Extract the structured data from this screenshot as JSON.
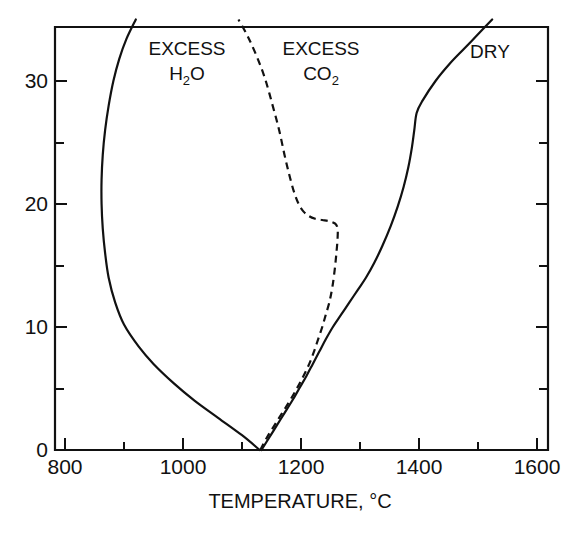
{
  "chart_data": {
    "type": "line",
    "title": "",
    "subtitle": "",
    "xlabel": "TEMPERATURE, °C",
    "ylabel": "",
    "xlim": [
      800,
      1600
    ],
    "ylim": [
      0,
      35
    ],
    "grid": false,
    "legend_position": "inline-annotations",
    "x_ticks_major": [
      800,
      1000,
      1200,
      1400,
      1600
    ],
    "x_ticks_minor": [
      900,
      1100,
      1300,
      1500
    ],
    "x_tick_labels": [
      "800",
      "1000",
      "1200",
      "1400",
      "1600"
    ],
    "y_ticks_major": [
      0,
      10,
      20,
      30
    ],
    "y_ticks_minor": [
      5,
      15,
      25
    ],
    "y_tick_labels": [
      "0",
      "10",
      "20",
      "30"
    ],
    "series": [
      {
        "name": "EXCESS H2O",
        "label_line1": "EXCESS",
        "label_line2_base": "H",
        "label_line2_sub": "2",
        "label_line2_tail": "O",
        "style": "solid",
        "color": "#111111",
        "x": [
          1130,
          1100,
          1060,
          1020,
          985,
          950,
          925,
          900,
          885,
          874,
          868,
          864,
          862,
          862,
          864,
          868,
          874,
          882,
          892,
          904,
          920
        ],
        "y": [
          0,
          1.2,
          2.6,
          4.0,
          5.4,
          7.0,
          8.4,
          10.2,
          12.0,
          14.0,
          16.0,
          18.0,
          20.0,
          22.0,
          24.0,
          26.0,
          28.0,
          30.0,
          31.8,
          33.4,
          35.0
        ]
      },
      {
        "name": "EXCESS CO2",
        "label_line1": "EXCESS",
        "label_line2_base": "CO",
        "label_line2_sub": "2",
        "label_line2_tail": "",
        "style": "dashed",
        "color": "#111111",
        "x": [
          1131,
          1142,
          1155,
          1168,
          1181,
          1193,
          1204,
          1214,
          1222,
          1229,
          1236,
          1242,
          1248,
          1253,
          1257,
          1260,
          1262,
          1262,
          1258,
          1248,
          1236,
          1224,
          1214,
          1204,
          1196,
          1188,
          1180,
          1172,
          1163,
          1152,
          1139,
          1125,
          1110,
          1094
        ],
        "y": [
          0,
          1.0,
          2.0,
          3.0,
          4.0,
          5.0,
          6.0,
          7.0,
          8.0,
          9.0,
          10.0,
          11.0,
          12.0,
          13.2,
          14.6,
          16.0,
          17.2,
          18.0,
          18.4,
          18.6,
          18.7,
          18.8,
          19.0,
          19.4,
          20.0,
          21.0,
          22.4,
          24.0,
          26.0,
          28.0,
          30.2,
          32.0,
          33.6,
          35.0
        ]
      },
      {
        "name": "DRY",
        "label_line1": "DRY",
        "label_line2_base": "",
        "label_line2_sub": "",
        "label_line2_tail": "",
        "style": "solid",
        "color": "#111111",
        "x": [
          1133,
          1146,
          1159,
          1172,
          1185,
          1197,
          1209,
          1220,
          1231,
          1242,
          1254,
          1268,
          1282,
          1296,
          1310,
          1324,
          1338,
          1352,
          1364,
          1374,
          1382,
          1388,
          1392,
          1396,
          1406,
          1428,
          1452,
          1476,
          1500,
          1524
        ],
        "y": [
          0,
          1.0,
          2.0,
          3.0,
          4.0,
          5.0,
          6.0,
          7.0,
          8.0,
          9.0,
          10.0,
          11.0,
          12.0,
          13.0,
          14.0,
          15.2,
          16.6,
          18.2,
          19.8,
          21.4,
          23.0,
          24.6,
          26.0,
          27.4,
          28.4,
          30.0,
          31.4,
          32.6,
          33.8,
          35.0
        ]
      }
    ],
    "annotations": [
      {
        "name": "excess-h2o-label",
        "text": "EXCESS H2O",
        "x_data": 985,
        "y_data": 33.5
      },
      {
        "name": "excess-co2-label",
        "text": "EXCESS CO2",
        "x_data": 1290,
        "y_data": 33.5
      },
      {
        "name": "dry-label",
        "text": "DRY",
        "x_data": 1505,
        "y_data": 33.6
      }
    ]
  },
  "labels": {
    "x_axis_title": "TEMPERATURE, °C",
    "series_h2o_line1": "EXCESS",
    "series_h2o_line2": "H",
    "series_h2o_sub": "2",
    "series_h2o_tail": "O",
    "series_co2_line1": "EXCESS",
    "series_co2_line2": "CO",
    "series_co2_sub": "2",
    "series_dry": "DRY",
    "xt0": "800",
    "xt1": "1000",
    "xt2": "1200",
    "xt3": "1400",
    "xt4": "1600",
    "yt0": "0",
    "yt1": "10",
    "yt2": "20",
    "yt3": "30"
  },
  "colors": {
    "ink": "#111111",
    "background": "#ffffff"
  }
}
